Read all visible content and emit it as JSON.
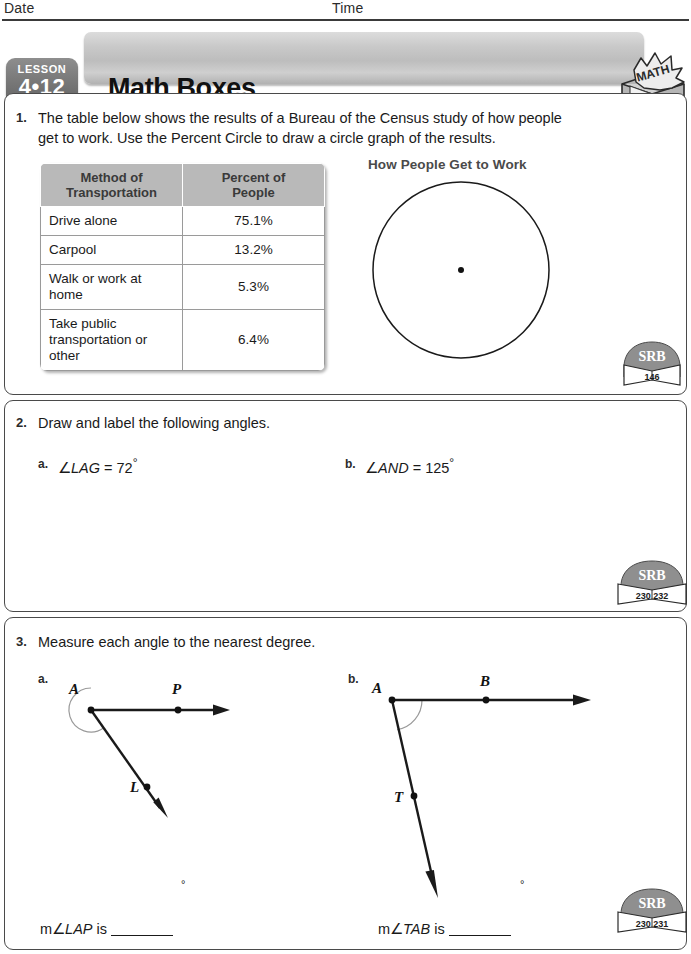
{
  "header": {
    "date_label": "Date",
    "time_label": "Time"
  },
  "banner": {
    "lesson_word": "LESSON",
    "lesson_number": "4•12",
    "title": "Math Boxes",
    "logo_text": "MATH"
  },
  "problems": [
    {
      "number": "1.",
      "text_line1": "The table below shows the results of a Bureau of the Census study of how people",
      "text_line2": "get to work. Use the Percent Circle to draw a circle graph of the results.",
      "table": {
        "headers": [
          "Method of Transportation",
          "Percent of People"
        ],
        "header_line1": [
          "Method of",
          "Percent of"
        ],
        "header_line2": [
          "Transportation",
          "People"
        ],
        "rows": [
          {
            "method": "Drive alone",
            "percent": "75.1%"
          },
          {
            "method": "Carpool",
            "percent": "13.2%"
          },
          {
            "method": "Walk or work at home",
            "percent": "5.3%"
          },
          {
            "method": "Take public transportation or other",
            "percent": "6.4%"
          }
        ]
      },
      "graph_title": "How People Get to Work",
      "srb": {
        "label": "SRB",
        "pages": "146"
      }
    },
    {
      "number": "2.",
      "text_line1": "Draw and label the following angles.",
      "parts": [
        {
          "letter": "a.",
          "prefix": "∠",
          "name": "LAG",
          "equals": " = 72",
          "degree": "°"
        },
        {
          "letter": "b.",
          "prefix": "∠",
          "name": "AND",
          "equals": " = 125",
          "degree": "°"
        }
      ],
      "srb": {
        "label": "SRB",
        "pages": "230  232"
      }
    },
    {
      "number": "3.",
      "text_line1": "Measure each angle to the nearest degree.",
      "parts": [
        {
          "letter": "a.",
          "vertex_label": "A",
          "point_labels": [
            "P",
            "L"
          ],
          "answer_prefix": "m∠",
          "answer_name": "LAP",
          "answer_suffix": " is",
          "degree": "°"
        },
        {
          "letter": "b.",
          "vertex_label": "A",
          "point_labels": [
            "B",
            "T"
          ],
          "answer_prefix": "m∠",
          "answer_name": "TAB",
          "answer_suffix": " is",
          "degree": "°"
        }
      ],
      "srb": {
        "label": "SRB",
        "pages": "230  231"
      }
    }
  ],
  "colors": {
    "banner_gray": "#c9c9c9",
    "badge_gray": "#787878",
    "table_header_gray": "#b9b9b9",
    "ink": "#1a1a1a"
  }
}
